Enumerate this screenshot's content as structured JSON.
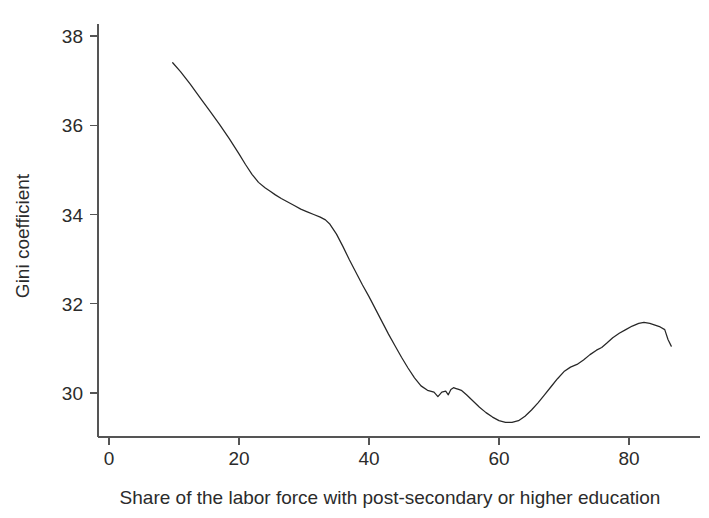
{
  "chart_data": {
    "type": "line",
    "title": "",
    "subtitle": "",
    "xlabel": "Share of the labor force with post-secondary or higher education",
    "ylabel": "Gini coefficient",
    "xlim": [
      0,
      88
    ],
    "ylim": [
      29.0,
      38.3
    ],
    "xticks": [
      0,
      20,
      40,
      60,
      80
    ],
    "xticklabels": [
      "0",
      "20",
      "40",
      "60",
      "80"
    ],
    "yticks": [
      30,
      32,
      34,
      36,
      38
    ],
    "yticklabels": [
      "30",
      "32",
      "34",
      "36",
      "38"
    ],
    "grid": false,
    "legend": false,
    "legend_position": "none",
    "line_color": "#272727",
    "axis_color": "#555555",
    "background_color": "#ffffff",
    "series": [
      {
        "name": "Gini coefficient",
        "x": [
          9.8,
          11.0,
          12.5,
          14.0,
          15.5,
          17.0,
          18.5,
          20.0,
          21.0,
          22.0,
          23.0,
          24.0,
          24.8,
          25.6,
          26.5,
          27.5,
          28.5,
          29.5,
          30.5,
          31.5,
          32.5,
          33.3,
          34.0,
          35.0,
          36.0,
          37.0,
          38.0,
          39.0,
          40.0,
          41.0,
          42.0,
          43.0,
          44.0,
          45.0,
          46.0,
          47.0,
          48.0,
          49.0,
          50.0,
          50.6,
          51.2,
          51.8,
          52.2,
          52.6,
          53.0,
          53.4,
          53.8,
          54.2,
          55.0,
          56.0,
          57.0,
          58.0,
          59.0,
          60.0,
          61.0,
          62.0,
          63.0,
          64.0,
          65.0,
          66.0,
          67.0,
          68.0,
          69.0,
          70.0,
          71.0,
          72.0,
          73.0,
          74.0,
          75.0,
          75.8,
          76.6,
          77.5,
          78.5,
          79.5,
          80.5,
          81.5,
          82.3,
          83.2,
          84.0,
          84.8,
          85.5,
          86.0,
          86.5
        ],
        "y": [
          37.4,
          37.2,
          36.92,
          36.62,
          36.32,
          36.02,
          35.7,
          35.36,
          35.12,
          34.9,
          34.72,
          34.6,
          34.52,
          34.44,
          34.36,
          34.28,
          34.2,
          34.12,
          34.06,
          34.0,
          33.94,
          33.88,
          33.78,
          33.56,
          33.28,
          32.98,
          32.7,
          32.42,
          32.16,
          31.88,
          31.6,
          31.32,
          31.06,
          30.8,
          30.56,
          30.34,
          30.16,
          30.06,
          30.02,
          29.92,
          30.02,
          30.04,
          29.96,
          30.08,
          30.12,
          30.1,
          30.08,
          30.06,
          29.96,
          29.82,
          29.68,
          29.56,
          29.46,
          29.38,
          29.34,
          29.34,
          29.38,
          29.48,
          29.62,
          29.78,
          29.96,
          30.14,
          30.32,
          30.48,
          30.58,
          30.64,
          30.74,
          30.86,
          30.96,
          31.02,
          31.12,
          31.24,
          31.34,
          31.42,
          31.5,
          31.56,
          31.58,
          31.56,
          31.52,
          31.48,
          31.42,
          31.2,
          31.05
        ]
      }
    ],
    "annotations": []
  },
  "figure": {
    "caption": ""
  }
}
